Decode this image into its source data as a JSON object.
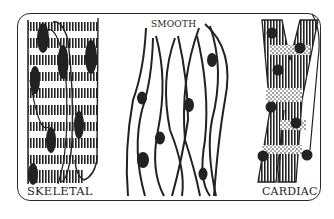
{
  "diagram": {
    "panels": [
      {
        "id": "skeletal",
        "label": "SKELETAL",
        "features": [
          "striated fibers",
          "multiple peripheral nuclei",
          "long cylindrical cells"
        ]
      },
      {
        "id": "smooth",
        "label": "SMOOTH",
        "features": [
          "spindle-shaped cells",
          "single central nucleus",
          "non-striated"
        ]
      },
      {
        "id": "cardiac",
        "label": "CARDIAC",
        "features": [
          "branched fibers",
          "striated",
          "central nuclei"
        ]
      }
    ],
    "colors": {
      "ink": "#222222",
      "background": "#ffffff",
      "frame": "#2a2a2a"
    }
  }
}
